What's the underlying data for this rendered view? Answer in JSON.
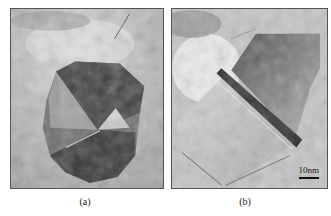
{
  "figure": {
    "panels": [
      {
        "id": "a",
        "label": "(a)",
        "description": "TEM micrograph of a polyhedral nanoparticle with multiply-twinned dark domains on a mottled gray background"
      },
      {
        "id": "b",
        "label": "(b)",
        "description": "TEM micrograph of a faceted nanocrystal with a diagonal dark twin band",
        "scale_bar": {
          "label": "10nm",
          "color": "#111111"
        }
      }
    ],
    "colors": {
      "background": "#ffffff",
      "panel_border": "#555555",
      "particle_dark": "#3a3a3a",
      "particle_mid": "#6a6a6a",
      "matrix_light": "#c9c9c9"
    }
  }
}
